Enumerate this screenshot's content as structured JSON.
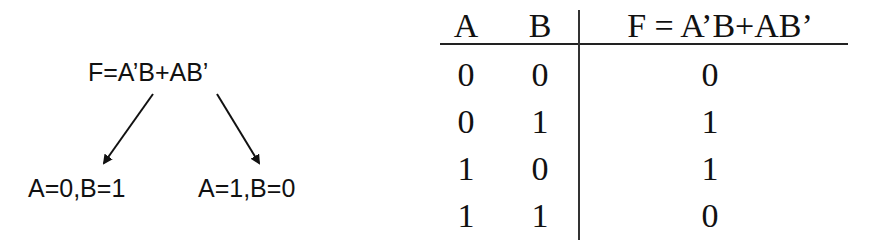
{
  "diagram": {
    "formula": "F=A’B+AB’",
    "cases": [
      {
        "label": "A=0,B=1"
      },
      {
        "label": "A=1,B=0"
      }
    ],
    "arrows": [
      {
        "from": "formula",
        "to": "case_left",
        "direction": "down-left"
      },
      {
        "from": "formula",
        "to": "case_right",
        "direction": "down-right"
      }
    ]
  },
  "truth_table": {
    "headers": [
      "A",
      "B",
      "F = A’B+AB’"
    ],
    "rows": [
      [
        "0",
        "0",
        "0"
      ],
      [
        "0",
        "1",
        "1"
      ],
      [
        "1",
        "0",
        "1"
      ],
      [
        "1",
        "1",
        "0"
      ]
    ]
  },
  "colors": {
    "ink": "#111111",
    "background": "#ffffff"
  }
}
